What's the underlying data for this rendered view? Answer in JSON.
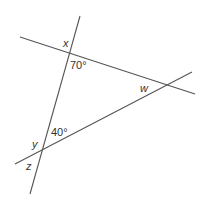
{
  "diagram": {
    "line_color": "#555555",
    "text_color": "#333333",
    "lines": [
      {
        "name": "steep-line",
        "x1": 80,
        "y1": 16,
        "x2": 30,
        "y2": 194
      },
      {
        "name": "upper-line",
        "x1": 20,
        "y1": 37,
        "x2": 195,
        "y2": 94
      },
      {
        "name": "lower-line",
        "x1": 15,
        "y1": 164,
        "x2": 192,
        "y2": 72
      }
    ],
    "labels": {
      "x": "x",
      "angle_70": "70°",
      "w": "w",
      "angle_40": "40°",
      "y": "y",
      "z": "z"
    }
  }
}
